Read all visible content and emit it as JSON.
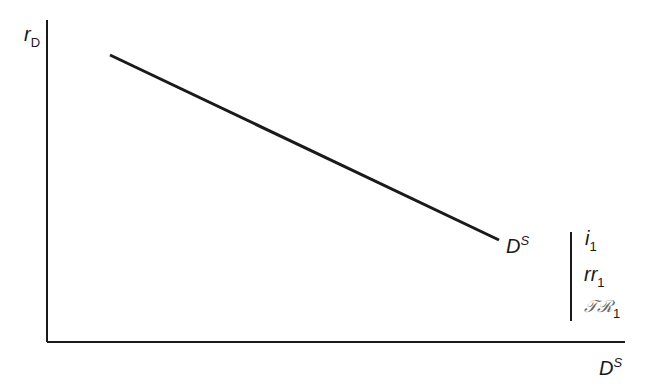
{
  "diagram": {
    "y_axis_label": {
      "base": "r",
      "sub": "D"
    },
    "x_axis_label": {
      "base": "D",
      "sup": "S"
    },
    "curve_label": {
      "base": "D",
      "sup": "S"
    },
    "shift_params": [
      {
        "base": "i",
        "sub": "1"
      },
      {
        "base": "rr",
        "sub": "1"
      },
      {
        "base": "𝒯ℛ",
        "sub": "1"
      }
    ],
    "line": {
      "x1": 110,
      "y1": 55,
      "x2": 499,
      "y2": 240,
      "color": "#1a1a1a"
    }
  }
}
